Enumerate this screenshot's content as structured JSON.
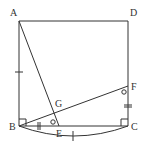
{
  "diagram": {
    "type": "geometry",
    "points": {
      "A": {
        "label": "A",
        "x": 19,
        "y": 21
      },
      "D": {
        "label": "D",
        "x": 128,
        "y": 21
      },
      "B": {
        "label": "B",
        "x": 19,
        "y": 126
      },
      "C": {
        "label": "C",
        "x": 128,
        "y": 126
      },
      "E": {
        "label": "E",
        "x": 59,
        "y": 126
      },
      "F": {
        "label": "F",
        "x": 128,
        "y": 86
      },
      "G": {
        "label": "G",
        "x": 53,
        "y": 113
      }
    },
    "segments": [
      "AB",
      "BC",
      "CD",
      "DA",
      "AE",
      "BF"
    ],
    "marks": {
      "right_angles": [
        "B",
        "C"
      ],
      "equal_single_tick": [
        "AB",
        "arc BC"
      ],
      "equal_double_tick": [
        "BE",
        "CF"
      ],
      "equal_angle_circle": [
        "angle GEB",
        "angle BFC"
      ]
    },
    "arc": {
      "from": "B",
      "to": "C",
      "label": "BC"
    },
    "colors": {
      "line": "#333333",
      "background": "#ffffff"
    }
  }
}
